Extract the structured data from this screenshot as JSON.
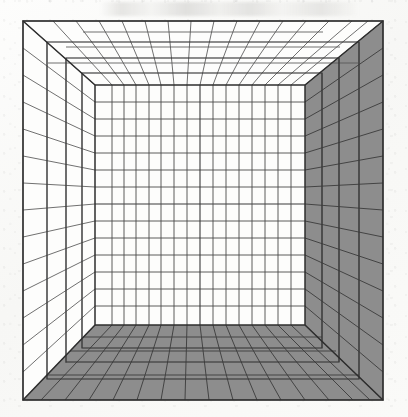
{
  "figure": {
    "medium": "line drawing on paper",
    "caption_text": "",
    "background_color": "#fbfbfa",
    "ink_color": "#4a4a4a",
    "ink_color_strong": "#3a3a3a",
    "shaded_fill": "#8d8d8d",
    "light_fill": "#fdfdfc"
  },
  "frame": {
    "label": "picture-plane-frame",
    "x": 23,
    "y": 21,
    "width": 360,
    "height": 379,
    "stroke": "#3a3a3a",
    "stroke_width": 1.6
  },
  "vanishing_point": {
    "label": "vanishing-point",
    "x": 200,
    "y": 205,
    "visible": false
  },
  "back_wall": {
    "label": "back-wall",
    "x": 95,
    "y": 85,
    "width": 210,
    "height": 240,
    "fill": "#fdfdfc",
    "grid_columns": 14,
    "grid_rows": 14,
    "grid_x": [
      95,
      110,
      125,
      140,
      155,
      170,
      185,
      200,
      215,
      230,
      245,
      260,
      275,
      290,
      305
    ],
    "grid_y": [
      85,
      102,
      119,
      136,
      153,
      170,
      187,
      204,
      221,
      238,
      255,
      272,
      289,
      306,
      325
    ]
  },
  "left_wall": {
    "label": "left-wall",
    "fill": "#fdfdfc",
    "shaded": false,
    "near_top_y": 21,
    "near_bottom_y": 400,
    "far_top_y": 85,
    "far_bottom_y": 325,
    "near_x": 23,
    "far_x": 95,
    "depth_lines": 4,
    "height_lines": 14
  },
  "right_wall": {
    "label": "right-wall",
    "fill": "#8d8d8d",
    "shaded": true,
    "near_top_y": 21,
    "near_bottom_y": 400,
    "far_top_y": 85,
    "far_bottom_y": 325,
    "near_x": 383,
    "far_x": 305,
    "depth_lines": 4,
    "height_lines": 14
  },
  "ceiling": {
    "label": "ceiling",
    "fill": "#fdfdfc",
    "shaded": false,
    "near_y": 21,
    "far_y": 85,
    "depth_lines": 4,
    "radiating_lines": 14
  },
  "floor": {
    "label": "floor",
    "fill": "#8d8d8d",
    "shaded": true,
    "near_y": 400,
    "far_y": 325,
    "depth_lines": 3,
    "radiating_lines": 14
  },
  "depth_steps": {
    "label": "orthogonal-depth-bands",
    "count": 4,
    "description": "receding rectangular bands between picture plane and back wall"
  },
  "annotations": {
    "smudge_present": true,
    "smudge_region": "upper margin"
  }
}
